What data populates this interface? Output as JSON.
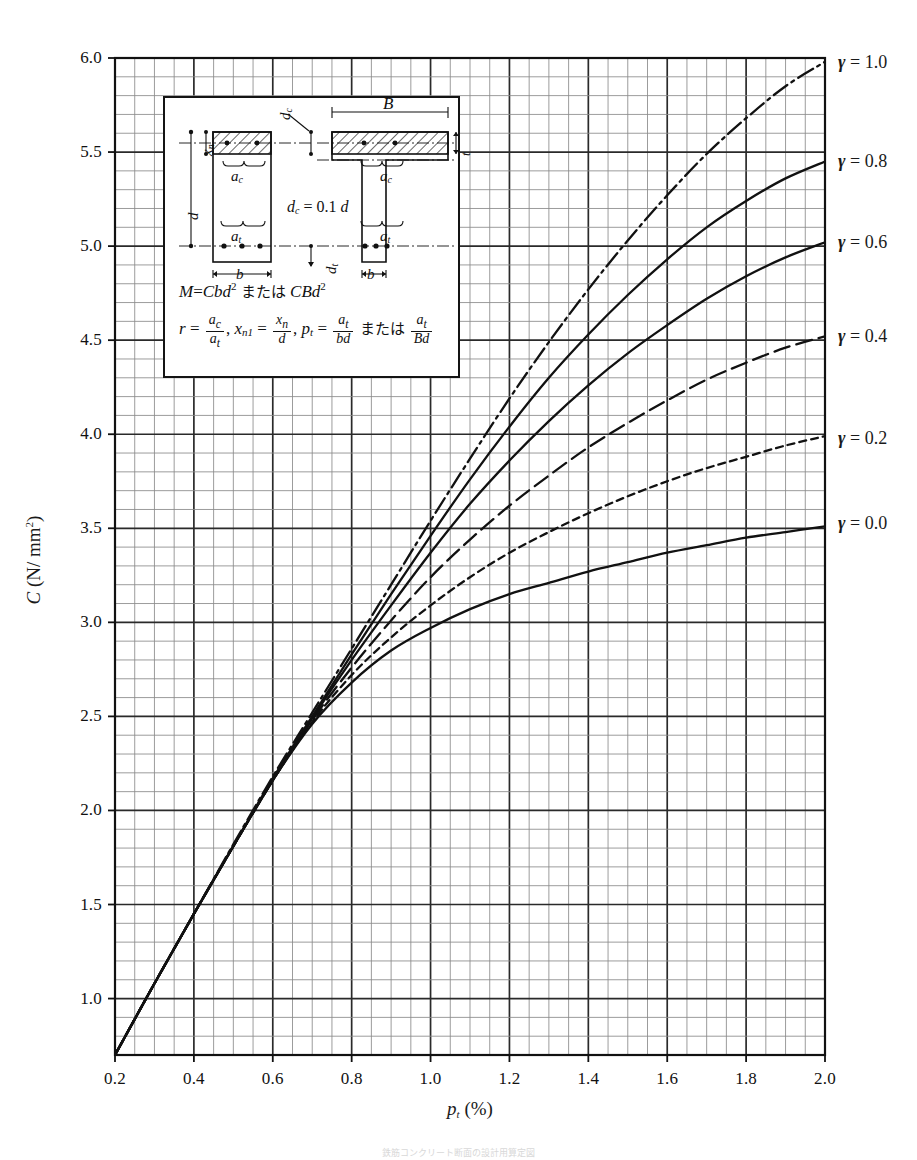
{
  "figure": {
    "caption": "鉄筋コンクリート断面の設計用算定図"
  },
  "axes": {
    "x_title_sym": "p",
    "x_title_sub": "t",
    "x_title_unit": "(%)",
    "y_title_sym": "C",
    "y_title_unit": "(N/ mm",
    "y_title_exp": "2",
    "y_title_close": ")",
    "x_ticks": [
      "0.2",
      "0.4",
      "0.6",
      "0.8",
      "1.0",
      "1.2",
      "1.4",
      "1.6",
      "1.8",
      "2.0"
    ],
    "y_ticks": [
      "1.0",
      "1.5",
      "2.0",
      "2.5",
      "3.0",
      "3.5",
      "4.0",
      "4.5",
      "5.0",
      "5.5",
      "6.0"
    ]
  },
  "legend_labels": [
    {
      "sym": "γ",
      "eq": "= 1.0"
    },
    {
      "sym": "γ",
      "eq": "= 0.8"
    },
    {
      "sym": "γ",
      "eq": "= 0.6"
    },
    {
      "sym": "γ",
      "eq": "= 0.4"
    },
    {
      "sym": "γ",
      "eq": "= 0.2"
    },
    {
      "sym": "γ",
      "eq": "= 0.0"
    }
  ],
  "inset": {
    "eq_m_lhs": "M",
    "eq_m_eq": "=",
    "eq_m_rhs1": "Cbd",
    "eq_m_exp1": "2",
    "eq_m_or": "または",
    "eq_m_rhs2": "CBd",
    "eq_m_exp2": "2",
    "eq_r_sym": "r",
    "eq_r_num": "a",
    "eq_r_num_sub": "c",
    "eq_r_den": "a",
    "eq_r_den_sub": "t",
    "eq_xn_sym": "x",
    "eq_xn_sub": "n1",
    "eq_xn_num": "x",
    "eq_xn_num_sub": "n",
    "eq_xn_den": "d",
    "eq_pt_sym": "p",
    "eq_pt_sub": "t",
    "eq_pt_num": "a",
    "eq_pt_num_sub": "t",
    "eq_pt_den": "bd",
    "eq_pt_or": "または",
    "eq_pt2_num": "a",
    "eq_pt2_num_sub": "t",
    "eq_pt2_den": "Bd",
    "dc_note_lhs": "d",
    "dc_note_sub": "c",
    "dc_note_rhs": "= 0.1",
    "dc_note_d": "d",
    "labels": {
      "d": "d",
      "xn": "x",
      "xn_sub": "n",
      "ac": "a",
      "ac_sub": "c",
      "at": "a",
      "at_sub": "t",
      "b": "b",
      "B": "B",
      "dc": "d",
      "dc_sub": "c",
      "dt": "d",
      "dt_sub": "t",
      "t": "t"
    }
  },
  "chart_data": {
    "type": "line",
    "title": "",
    "xlabel": "p_t (%)",
    "ylabel": "C (N/mm^2)",
    "xlim": [
      0.2,
      2.0
    ],
    "ylim": [
      0.7,
      6.0
    ],
    "x_major_step": 0.2,
    "y_major_step": 0.5,
    "x_minor_step": 0.05,
    "y_minor_step": 0.1,
    "grid": true,
    "legend_position": "right-outside",
    "colors": {
      "line": "#111111",
      "grid_major": "#2a2a2a",
      "grid_minor": "#8a8a8a"
    },
    "series": [
      {
        "name": "γ = 0.0",
        "style": "solid",
        "label_y": 3.53,
        "x": [
          0.2,
          0.3,
          0.4,
          0.5,
          0.6,
          0.7,
          0.8,
          0.9,
          1.0,
          1.1,
          1.2,
          1.3,
          1.4,
          1.5,
          1.6,
          1.7,
          1.8,
          1.9,
          2.0
        ],
        "y": [
          0.7,
          1.08,
          1.45,
          1.81,
          2.16,
          2.46,
          2.68,
          2.85,
          2.97,
          3.07,
          3.15,
          3.21,
          3.27,
          3.32,
          3.37,
          3.41,
          3.45,
          3.48,
          3.51
        ]
      },
      {
        "name": "γ = 0.2",
        "style": "dotted",
        "label_y": 3.98,
        "x": [
          0.2,
          0.3,
          0.4,
          0.5,
          0.6,
          0.7,
          0.8,
          0.9,
          1.0,
          1.1,
          1.2,
          1.3,
          1.4,
          1.5,
          1.6,
          1.7,
          1.8,
          1.9,
          2.0
        ],
        "y": [
          0.7,
          1.08,
          1.45,
          1.81,
          2.16,
          2.47,
          2.72,
          2.92,
          3.09,
          3.24,
          3.37,
          3.48,
          3.58,
          3.67,
          3.75,
          3.82,
          3.88,
          3.94,
          3.99
        ]
      },
      {
        "name": "γ = 0.4",
        "style": "dashed",
        "label_y": 4.52,
        "x": [
          0.2,
          0.3,
          0.4,
          0.5,
          0.6,
          0.7,
          0.8,
          0.9,
          1.0,
          1.1,
          1.2,
          1.3,
          1.4,
          1.5,
          1.6,
          1.7,
          1.8,
          1.9,
          2.0
        ],
        "y": [
          0.7,
          1.08,
          1.45,
          1.81,
          2.16,
          2.48,
          2.76,
          3.01,
          3.24,
          3.44,
          3.62,
          3.78,
          3.93,
          4.06,
          4.18,
          4.29,
          4.38,
          4.46,
          4.52
        ]
      },
      {
        "name": "γ = 0.6",
        "style": "solid",
        "label_y": 5.02,
        "x": [
          0.2,
          0.3,
          0.4,
          0.5,
          0.6,
          0.7,
          0.8,
          0.9,
          1.0,
          1.1,
          1.2,
          1.3,
          1.4,
          1.5,
          1.6,
          1.7,
          1.8,
          1.9,
          2.0
        ],
        "y": [
          0.7,
          1.08,
          1.45,
          1.81,
          2.16,
          2.49,
          2.8,
          3.09,
          3.37,
          3.63,
          3.86,
          4.07,
          4.26,
          4.43,
          4.58,
          4.72,
          4.84,
          4.94,
          5.02
        ]
      },
      {
        "name": "γ = 0.8",
        "style": "solid",
        "label_y": 5.45,
        "x": [
          0.2,
          0.3,
          0.4,
          0.5,
          0.6,
          0.7,
          0.8,
          0.9,
          1.0,
          1.1,
          1.2,
          1.3,
          1.4,
          1.5,
          1.6,
          1.7,
          1.8,
          1.9,
          2.0
        ],
        "y": [
          0.7,
          1.08,
          1.45,
          1.81,
          2.17,
          2.5,
          2.83,
          3.15,
          3.46,
          3.76,
          4.04,
          4.3,
          4.53,
          4.74,
          4.93,
          5.1,
          5.24,
          5.36,
          5.45
        ]
      },
      {
        "name": "γ = 1.0",
        "style": "dashdot",
        "label_y": 5.98,
        "x": [
          0.2,
          0.3,
          0.4,
          0.5,
          0.6,
          0.7,
          0.8,
          0.9,
          1.0,
          1.1,
          1.2,
          1.3,
          1.4,
          1.5,
          1.6,
          1.7,
          1.8,
          1.9,
          2.0
        ],
        "y": [
          0.7,
          1.08,
          1.45,
          1.82,
          2.18,
          2.52,
          2.86,
          3.2,
          3.54,
          3.87,
          4.19,
          4.49,
          4.77,
          5.03,
          5.27,
          5.49,
          5.68,
          5.85,
          5.98
        ]
      }
    ]
  }
}
